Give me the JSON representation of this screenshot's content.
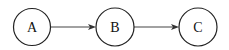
{
  "diagram": {
    "type": "directed-graph",
    "nodes": [
      {
        "id": "A",
        "label": "A",
        "cx": 32,
        "cy": 27,
        "r": 18.5
      },
      {
        "id": "B",
        "label": "B",
        "cx": 115,
        "cy": 27,
        "r": 19
      },
      {
        "id": "C",
        "label": "C",
        "cx": 198,
        "cy": 27,
        "r": 19
      }
    ],
    "edges": [
      {
        "from": "A",
        "to": "B"
      },
      {
        "from": "B",
        "to": "C"
      }
    ],
    "colors": {
      "stroke": "#222222",
      "background": "#ffffff"
    }
  }
}
